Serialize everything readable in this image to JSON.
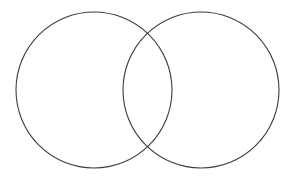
{
  "figure": {
    "background_color": "#ffffff",
    "width": 296,
    "height": 180
  },
  "chart_data": {
    "type": "diagram",
    "subtype": "venn",
    "title": "",
    "set_count": 2,
    "labels": [],
    "sets": [
      {
        "id": "set-a",
        "name": "left-circle",
        "cx": 94,
        "cy": 90,
        "r": 78,
        "stroke": "#3a3a3a",
        "stroke_width": 1.1,
        "fill": "none"
      },
      {
        "id": "set-b",
        "name": "right-circle",
        "cx": 201,
        "cy": 90,
        "r": 78,
        "stroke": "#3a3a3a",
        "stroke_width": 1.1,
        "fill": "none"
      }
    ],
    "intersection": {
      "overlap_width": 49,
      "upper_crossing": [
        147.5,
        33
      ],
      "lower_crossing": [
        147.5,
        147
      ],
      "fill": "none"
    },
    "bounds": {
      "left_circle_x": [
        16,
        172
      ],
      "right_circle_x": [
        123,
        279
      ],
      "circles_y": [
        12,
        168
      ]
    }
  }
}
